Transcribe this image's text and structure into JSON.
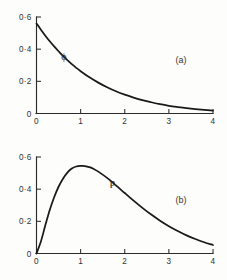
{
  "figure": {
    "background_color": "#fdfdfc",
    "ink_color": "#191919",
    "axis_color": "#2b2b2b"
  },
  "chart_data": [
    {
      "type": "line",
      "panel_label": "(a)",
      "title": "",
      "subtitle": "",
      "xlabel": "",
      "ylabel": "",
      "series_label": "ϕ",
      "series_label_x": 0.62,
      "series_label_y": 0.335,
      "xlim": [
        0,
        4
      ],
      "ylim": [
        0,
        0.6
      ],
      "xticks": [
        0,
        1,
        2,
        3,
        4
      ],
      "xticklabels": [
        "0",
        "1",
        "2",
        "3",
        "4"
      ],
      "yticks": [
        0,
        0.2,
        0.4,
        0.6
      ],
      "yticklabels": [
        "0",
        "0·2",
        "0·4",
        "0·6"
      ],
      "grid": false,
      "legend": "none",
      "spines": [
        "left",
        "bottom"
      ],
      "tick_direction": "in",
      "series": [
        {
          "name": "ϕ",
          "x": [
            0.0,
            0.1,
            0.2,
            0.3,
            0.4,
            0.5,
            0.6,
            0.7,
            0.8,
            0.9,
            1.0,
            1.2,
            1.4,
            1.6,
            1.8,
            2.0,
            2.2,
            2.4,
            2.6,
            2.8,
            3.0,
            3.2,
            3.4,
            3.6,
            3.8,
            4.0
          ],
          "values": [
            0.56,
            0.521,
            0.484,
            0.449,
            0.417,
            0.387,
            0.358,
            0.332,
            0.307,
            0.284,
            0.263,
            0.225,
            0.192,
            0.163,
            0.138,
            0.117,
            0.099,
            0.083,
            0.07,
            0.058,
            0.048,
            0.04,
            0.033,
            0.027,
            0.022,
            0.018
          ]
        }
      ]
    },
    {
      "type": "line",
      "panel_label": "(b)",
      "title": "",
      "subtitle": "",
      "xlabel": "",
      "ylabel": "",
      "series_label": "P",
      "series_label_x": 1.72,
      "series_label_y": 0.405,
      "xlim": [
        0,
        4
      ],
      "ylim": [
        0,
        0.6
      ],
      "xticks": [
        0,
        1,
        2,
        3,
        4
      ],
      "xticklabels": [
        "0",
        "1",
        "2",
        "3",
        "4"
      ],
      "yticks": [
        0,
        0.2,
        0.4,
        0.6
      ],
      "yticklabels": [
        "0",
        "0·2",
        "0·4",
        "0·6"
      ],
      "grid": false,
      "legend": "none",
      "spines": [
        "left",
        "bottom"
      ],
      "tick_direction": "in",
      "series": [
        {
          "name": "P",
          "x": [
            0.0,
            0.1,
            0.2,
            0.3,
            0.4,
            0.5,
            0.6,
            0.7,
            0.8,
            0.9,
            1.0,
            1.1,
            1.2,
            1.3,
            1.4,
            1.6,
            1.8,
            2.0,
            2.2,
            2.4,
            2.6,
            2.8,
            3.0,
            3.2,
            3.4,
            3.6,
            3.8,
            4.0
          ],
          "values": [
            0.0,
            0.075,
            0.175,
            0.27,
            0.35,
            0.415,
            0.465,
            0.503,
            0.528,
            0.541,
            0.545,
            0.544,
            0.537,
            0.525,
            0.509,
            0.47,
            0.424,
            0.376,
            0.329,
            0.284,
            0.242,
            0.204,
            0.17,
            0.14,
            0.113,
            0.09,
            0.07,
            0.053
          ]
        }
      ]
    }
  ]
}
